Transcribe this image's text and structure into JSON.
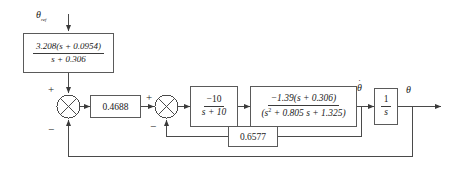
{
  "diagram": {
    "colors": {
      "line": "#4a4a4a",
      "block_border": "#5a5a5a",
      "text": "#1a1a1a",
      "background": "#ffffff"
    },
    "signals": {
      "reference": "θ",
      "reference_subscript": "ref",
      "theta_dot": "θ",
      "theta": "θ"
    },
    "blocks": {
      "lead_compensator": {
        "numerator": "3.208(s + 0.0954)",
        "denominator": "s + 0.306"
      },
      "gain": {
        "value": "0.4688"
      },
      "actuator": {
        "numerator": "−10",
        "denominator": "s + 10"
      },
      "plant": {
        "numerator": "−1.39(s  +  0.306)",
        "denominator_prefix": "(s",
        "denominator_exponent": "2",
        "denominator_rest": "  +  0.805 s  +  1.325)"
      },
      "integrator": {
        "numerator": "1",
        "denominator": "s"
      },
      "rate_feedback": {
        "value": "0.6577"
      }
    },
    "summing_junctions": {
      "outer": {
        "plus": "+",
        "minus": "−"
      },
      "inner": {
        "plus": "+",
        "minus": "−"
      }
    }
  }
}
